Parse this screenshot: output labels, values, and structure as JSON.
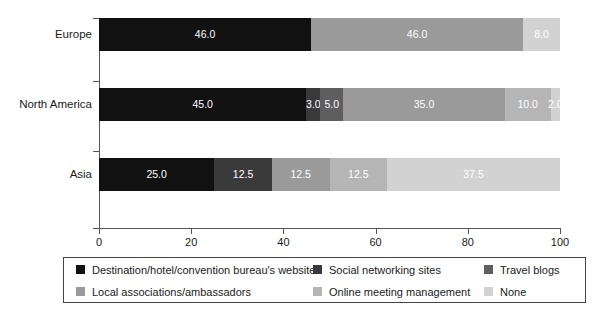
{
  "chart_data": {
    "type": "bar",
    "orientation": "horizontal",
    "stacked": true,
    "normalized_percent": true,
    "title": "",
    "xlabel": "",
    "ylabel": "",
    "xlim": [
      0,
      100
    ],
    "xticks": [
      0,
      20,
      40,
      60,
      80,
      100
    ],
    "xtick_labels": [
      "0",
      "20",
      "40",
      "60",
      "80",
      "100"
    ],
    "grid": false,
    "legend_position": "bottom",
    "categories": [
      "Europe",
      "North America",
      "Asia"
    ],
    "series": [
      {
        "name": "Destination/hotel/convention bureau's website",
        "color": "#111111",
        "values": [
          46.0,
          45.0,
          25.0
        ],
        "labels": [
          "46.0",
          "45.0",
          "25.0"
        ]
      },
      {
        "name": "Social networking sites",
        "color": "#3a3a3a",
        "values": [
          0.0,
          3.0,
          12.5
        ],
        "labels": [
          "",
          "3.0",
          "12.5"
        ]
      },
      {
        "name": "Travel blogs",
        "color": "#5e5e5e",
        "values": [
          0.0,
          5.0,
          0.0
        ],
        "labels": [
          "",
          "5.0",
          ""
        ]
      },
      {
        "name": "Local associations/ambassadors",
        "color": "#9a9a9a",
        "values": [
          46.0,
          35.0,
          12.5
        ],
        "labels": [
          "46.0",
          "35.0",
          "12.5"
        ]
      },
      {
        "name": "Online meeting management",
        "color": "#b5b5b5",
        "values": [
          0.0,
          10.0,
          12.5
        ],
        "labels": [
          "",
          "10.0",
          "12.5"
        ]
      },
      {
        "name": "None",
        "color": "#d2d2d2",
        "values": [
          8.0,
          2.0,
          37.5
        ],
        "labels": [
          "8.0",
          "2.0",
          "37.5"
        ]
      }
    ]
  },
  "axis": {
    "x_tick_labels": [
      "0",
      "20",
      "40",
      "60",
      "80",
      "100"
    ],
    "y_tick_labels": [
      "Europe",
      "North America",
      "Asia"
    ]
  },
  "legend": {
    "items": [
      {
        "label": "Destination/hotel/convention bureau's website",
        "color": "#111111"
      },
      {
        "label": "Social networking sites",
        "color": "#3a3a3a"
      },
      {
        "label": "Travel blogs",
        "color": "#5e5e5e"
      },
      {
        "label": "Local associations/ambassadors",
        "color": "#9a9a9a"
      },
      {
        "label": "Online meeting management",
        "color": "#b5b5b5"
      },
      {
        "label": "None",
        "color": "#d2d2d2"
      }
    ]
  }
}
